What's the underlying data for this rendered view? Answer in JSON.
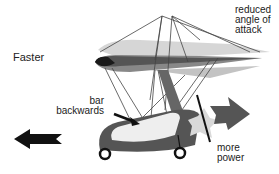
{
  "diagram": {
    "labels": {
      "faster": "Faster",
      "reduced_angle": [
        "reduced",
        "angle of",
        "attack"
      ],
      "bar_backwards": [
        "bar",
        "backwards"
      ],
      "more_power": [
        "more",
        "power"
      ]
    },
    "colors": {
      "wing_dark": "#1a1a1a",
      "wing_mid": "#777777",
      "wing_light": "#bbbbbb",
      "pod_dark": "#555555",
      "pod_light": "#e6e6e6",
      "engine": "#d9d9d9",
      "arrow_dark": "#111111",
      "arrow_gray": "#555555",
      "rigging": "#444444"
    }
  }
}
